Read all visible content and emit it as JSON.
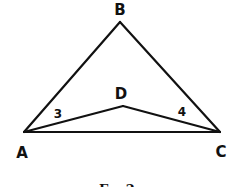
{
  "figure": {
    "caption": "Ex. 2",
    "stroke_color": "#111111",
    "background": "#ffffff"
  },
  "points": {
    "A": {
      "label": "A",
      "x": 24,
      "y": 132
    },
    "B": {
      "label": "B",
      "x": 120,
      "y": 22
    },
    "C": {
      "label": "C",
      "x": 220,
      "y": 132
    },
    "D": {
      "label": "D",
      "x": 123,
      "y": 106
    }
  },
  "segments": [
    [
      "A",
      "B"
    ],
    [
      "B",
      "C"
    ],
    [
      "A",
      "C"
    ],
    [
      "A",
      "D"
    ],
    [
      "D",
      "C"
    ]
  ],
  "angle_labels": {
    "angle3": {
      "label": "3",
      "at_vertex": "A"
    },
    "angle4": {
      "label": "4",
      "at_vertex": "C"
    }
  }
}
